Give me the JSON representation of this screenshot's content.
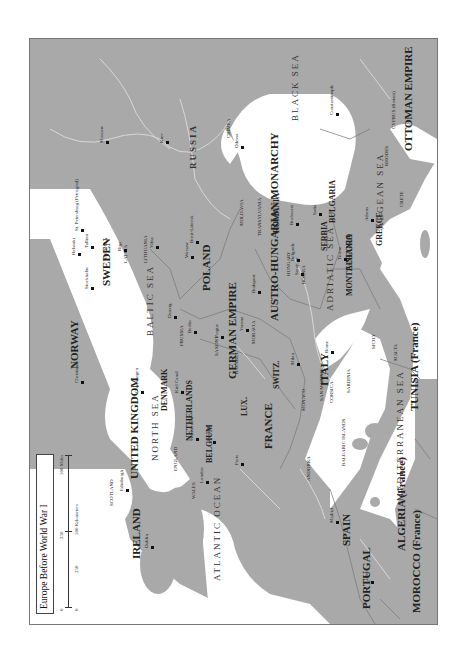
{
  "title": "Europe Before World War I",
  "scale": {
    "miles_ticks": [
      "0",
      "250",
      "500 Miles"
    ],
    "km_ticks": [
      "0",
      "250",
      "500 Kilometers"
    ]
  },
  "colors": {
    "land": "#a9a9a9",
    "water": "#ffffff",
    "border": "#777777",
    "river": "#d8d8d8"
  },
  "countries": [
    {
      "name": "RUSSIA",
      "x": 188,
      "y": 168,
      "cls": "big sea"
    },
    {
      "name": "OTTOMAN EMPIRE",
      "x": 402,
      "y": 150,
      "cls": "big"
    },
    {
      "name": "GERMAN EMPIRE",
      "x": 226,
      "y": 378,
      "cls": "big"
    },
    {
      "name": "AUSTRO-HUNGARIAN MONARCHY",
      "x": 268,
      "y": 320,
      "cls": "big"
    },
    {
      "name": "FRANCE",
      "x": 262,
      "y": 448,
      "cls": "big"
    },
    {
      "name": "SPAIN",
      "x": 340,
      "y": 545,
      "cls": "big"
    },
    {
      "name": "PORTUGAL",
      "x": 360,
      "y": 608,
      "cls": "big"
    },
    {
      "name": "ITALY",
      "x": 318,
      "y": 385,
      "cls": "big"
    },
    {
      "name": "SWEDEN",
      "x": 100,
      "y": 285,
      "cls": "big"
    },
    {
      "name": "NORWAY",
      "x": 68,
      "y": 368,
      "cls": "big"
    },
    {
      "name": "UNITED KINGDOM",
      "x": 128,
      "y": 478,
      "cls": "big"
    },
    {
      "name": "IRELAND",
      "x": 130,
      "y": 558,
      "cls": "big"
    },
    {
      "name": "POLAND",
      "x": 200,
      "y": 290,
      "cls": "big"
    },
    {
      "name": "ROMANIA",
      "x": 272,
      "y": 232,
      "cls": "med"
    },
    {
      "name": "BULGARIA",
      "x": 328,
      "y": 222,
      "cls": "med"
    },
    {
      "name": "SERBIA",
      "x": 320,
      "y": 250,
      "cls": "med"
    },
    {
      "name": "GREECE",
      "x": 375,
      "y": 245,
      "cls": "med"
    },
    {
      "name": "ALBANIA",
      "x": 345,
      "y": 270,
      "cls": "med"
    },
    {
      "name": "MONTE-NEGRO",
      "x": 345,
      "y": 295,
      "cls": "med"
    },
    {
      "name": "BELGIUM",
      "x": 205,
      "y": 462,
      "cls": "med"
    },
    {
      "name": "NETHERLANDS",
      "x": 185,
      "y": 440,
      "cls": "med"
    },
    {
      "name": "DENMARK",
      "x": 160,
      "y": 410,
      "cls": "med"
    },
    {
      "name": "SWITZ.",
      "x": 272,
      "y": 388,
      "cls": "med"
    },
    {
      "name": "LUX.",
      "x": 240,
      "y": 415,
      "cls": "med"
    },
    {
      "name": "ALGERIA (France)",
      "x": 395,
      "y": 550,
      "cls": "big"
    },
    {
      "name": "MOROCCO (France)",
      "x": 410,
      "y": 612,
      "cls": "big"
    },
    {
      "name": "TUNISIA (France)",
      "x": 408,
      "y": 410,
      "cls": "big"
    },
    {
      "name": "ANDORRA",
      "x": 305,
      "y": 480,
      "cls": "sm"
    },
    {
      "name": "MONACO",
      "x": 300,
      "y": 410,
      "cls": "sm"
    },
    {
      "name": "SAN MARINO",
      "x": 318,
      "y": 400,
      "cls": "sm"
    },
    {
      "name": "BOSNIA",
      "x": 300,
      "y": 283,
      "cls": "sm"
    },
    {
      "name": "HUNGARY",
      "x": 285,
      "y": 275,
      "cls": "sm"
    },
    {
      "name": "TRANSYLVANIA",
      "x": 256,
      "y": 235,
      "cls": "sm"
    },
    {
      "name": "MOLDAVIA",
      "x": 238,
      "y": 225,
      "cls": "sm"
    },
    {
      "name": "PRUSSIA",
      "x": 178,
      "y": 345,
      "cls": "sm"
    },
    {
      "name": "MORAVIA",
      "x": 250,
      "y": 343,
      "cls": "sm"
    },
    {
      "name": "SAXONY",
      "x": 213,
      "y": 355,
      "cls": "sm"
    },
    {
      "name": "BAVARIA",
      "x": 233,
      "y": 373,
      "cls": "sm"
    },
    {
      "name": "LATVIA",
      "x": 122,
      "y": 262,
      "cls": "sm"
    },
    {
      "name": "LITHUANIA",
      "x": 142,
      "y": 262,
      "cls": "sm"
    },
    {
      "name": "ESTONIA",
      "x": 102,
      "y": 258,
      "cls": "sm"
    },
    {
      "name": "ENGLAND",
      "x": 172,
      "y": 470,
      "cls": "sm"
    },
    {
      "name": "SCOTLAND",
      "x": 108,
      "y": 505,
      "cls": "sm"
    },
    {
      "name": "WALES",
      "x": 190,
      "y": 498,
      "cls": "sm"
    },
    {
      "name": "CORSICA",
      "x": 328,
      "y": 402,
      "cls": "sm"
    },
    {
      "name": "SARDINIA",
      "x": 345,
      "y": 392,
      "cls": "sm"
    },
    {
      "name": "SICILY",
      "x": 370,
      "y": 348,
      "cls": "sm"
    },
    {
      "name": "CRETE",
      "x": 398,
      "y": 206,
      "cls": "sm"
    },
    {
      "name": "RHODES",
      "x": 383,
      "y": 165,
      "cls": "sm"
    },
    {
      "name": "CYPRUS (Britain)",
      "x": 390,
      "y": 128,
      "cls": "sm"
    },
    {
      "name": "MALTA",
      "x": 392,
      "y": 360,
      "cls": "sm"
    },
    {
      "name": "CRIMEA",
      "x": 225,
      "y": 137,
      "cls": "sm"
    },
    {
      "name": "BALEARIC ISLANDS",
      "x": 340,
      "y": 465,
      "cls": "sm"
    }
  ],
  "seas": [
    {
      "name": "ATLANTIC OCEAN",
      "x": 212,
      "y": 580
    },
    {
      "name": "NORTH SEA",
      "x": 150,
      "y": 460
    },
    {
      "name": "BALTIC SEA",
      "x": 145,
      "y": 335
    },
    {
      "name": "BLACK SEA",
      "x": 290,
      "y": 120
    },
    {
      "name": "ADRIATIC SEA",
      "x": 325,
      "y": 310
    },
    {
      "name": "AEGEAN SEA",
      "x": 375,
      "y": 228
    },
    {
      "name": "MEDITERRANEAN SEA",
      "x": 395,
      "y": 500
    }
  ],
  "cities": [
    {
      "name": "Moscow",
      "x": 105,
      "y": 140
    },
    {
      "name": "St. Petersburg (Petrograd)",
      "x": 80,
      "y": 228
    },
    {
      "name": "Helsinki",
      "x": 77,
      "y": 252
    },
    {
      "name": "Tallinn",
      "x": 90,
      "y": 245
    },
    {
      "name": "Stockholm",
      "x": 90,
      "y": 286
    },
    {
      "name": "Christiania",
      "x": 80,
      "y": 380
    },
    {
      "name": "Copenhagen",
      "x": 140,
      "y": 390
    },
    {
      "name": "Riga",
      "x": 123,
      "y": 248
    },
    {
      "name": "Vilna",
      "x": 155,
      "y": 245
    },
    {
      "name": "Warsaw",
      "x": 190,
      "y": 255
    },
    {
      "name": "Brest-Litovsk",
      "x": 195,
      "y": 240
    },
    {
      "name": "Berlin",
      "x": 193,
      "y": 330
    },
    {
      "name": "Danzig",
      "x": 173,
      "y": 315
    },
    {
      "name": "Prague",
      "x": 220,
      "y": 335
    },
    {
      "name": "Vienna",
      "x": 245,
      "y": 328
    },
    {
      "name": "Budapest",
      "x": 257,
      "y": 290
    },
    {
      "name": "Bucharest",
      "x": 295,
      "y": 222
    },
    {
      "name": "Belgrade",
      "x": 296,
      "y": 258
    },
    {
      "name": "Sofia",
      "x": 318,
      "y": 212
    },
    {
      "name": "Constantinople",
      "x": 335,
      "y": 112
    },
    {
      "name": "Athens",
      "x": 370,
      "y": 218
    },
    {
      "name": "Sarajevo",
      "x": 300,
      "y": 272
    },
    {
      "name": "Tirana",
      "x": 343,
      "y": 257
    },
    {
      "name": "Rome",
      "x": 330,
      "y": 350
    },
    {
      "name": "Milan",
      "x": 296,
      "y": 362
    },
    {
      "name": "Paris",
      "x": 240,
      "y": 462
    },
    {
      "name": "Brussels",
      "x": 212,
      "y": 440
    },
    {
      "name": "Amsterdam",
      "x": 195,
      "y": 437
    },
    {
      "name": "London",
      "x": 205,
      "y": 480
    },
    {
      "name": "Dublin",
      "x": 150,
      "y": 545
    },
    {
      "name": "Madrid",
      "x": 335,
      "y": 520
    },
    {
      "name": "Lisbon",
      "x": 370,
      "y": 580
    },
    {
      "name": "Kiev",
      "x": 165,
      "y": 140
    },
    {
      "name": "Odessa",
      "x": 240,
      "y": 145
    },
    {
      "name": "Kiel Canal",
      "x": 180,
      "y": 390
    },
    {
      "name": "Edinburgh",
      "x": 125,
      "y": 488
    },
    {
      "name": "Tiflis",
      "x": 330,
      "y": 30
    }
  ],
  "rivers": [
    "Volga R.",
    "Dnieper R.",
    "Danube R.",
    "Vistula R.",
    "Oder R.",
    "Rhine R.",
    "Seine R.",
    "Loire R.",
    "Rhone R.",
    "Po R.",
    "Euphrates R.",
    "Tigris R.",
    "Dniester R.",
    "Elbe R.",
    "Marne R."
  ]
}
